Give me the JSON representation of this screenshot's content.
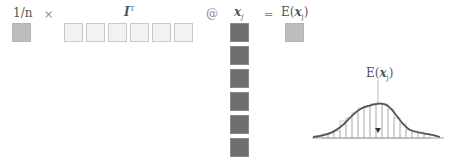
{
  "equation": {
    "scalar_label": "1/n",
    "times_op": "×",
    "ones_label": "I",
    "ones_sup": "T",
    "matmul_op": "@",
    "x_label": "x",
    "x_sub": "j",
    "equals_op": "=",
    "result_label_prefix": "E(",
    "result_label_var": "x",
    "result_label_sub": "j",
    "result_label_suffix": ")",
    "ones_count": 6,
    "x_count": 6
  },
  "colors": {
    "scalar": "#bdbdbd",
    "ones": "#f2f2f2",
    "x_column": "#6e6e6e",
    "result": "#bdbdbd",
    "curve": "#555555"
  },
  "distribution": {
    "label_prefix": "E(",
    "label_var": "x",
    "label_sub": "j",
    "label_suffix": ")",
    "marker": "▼"
  }
}
